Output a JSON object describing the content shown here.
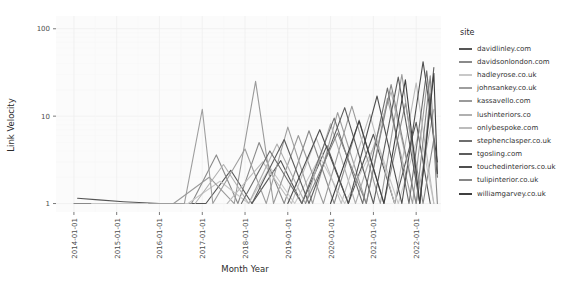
{
  "chart_data": {
    "type": "line",
    "title": "",
    "xlabel": "Month Year",
    "ylabel": "Link Velocity",
    "yscale": "log",
    "ylim": [
      0.8,
      140
    ],
    "ytick_labels": [
      "1",
      "10",
      "100"
    ],
    "ytick_values": [
      1,
      10,
      100
    ],
    "xtick_labels": [
      "2014-01-01",
      "2015-01-01",
      "2016-01-01",
      "2017-01-01",
      "2018-01-01",
      "2019-01-01",
      "2020-01-01",
      "2021-01-01",
      "2022-01-01"
    ],
    "xlim": [
      "2013-08-01",
      "2022-08-01"
    ],
    "grid": true,
    "legend_position": "right",
    "legend_title": "site",
    "series": [
      {
        "name": "davidlinley.com",
        "color": "#555555",
        "points": [
          [
            "2014-02-01",
            1.15
          ],
          [
            "2014-08-01",
            1.1
          ],
          [
            "2015-03-01",
            1.05
          ],
          [
            "2016-01-01",
            1.0
          ],
          [
            "2016-06-01",
            1.0
          ],
          [
            "2017-02-01",
            1.0
          ],
          [
            "2017-09-01",
            2.4
          ],
          [
            "2018-03-01",
            1.0
          ],
          [
            "2018-11-01",
            3.1
          ],
          [
            "2019-05-01",
            1.0
          ],
          [
            "2019-12-01",
            4.6
          ],
          [
            "2020-06-01",
            1.0
          ],
          [
            "2021-01-01",
            6.2
          ],
          [
            "2021-07-01",
            1.0
          ],
          [
            "2022-01-01",
            8.5
          ],
          [
            "2022-05-01",
            1.0
          ]
        ]
      },
      {
        "name": "davidsonlondon.com",
        "color": "#8a8a8a",
        "points": [
          [
            "2014-01-01",
            1.0
          ],
          [
            "2015-01-01",
            1.0
          ],
          [
            "2016-02-01",
            1.0
          ],
          [
            "2016-10-01",
            1.0
          ],
          [
            "2017-05-01",
            3.6
          ],
          [
            "2017-11-01",
            1.0
          ],
          [
            "2018-05-01",
            5.0
          ],
          [
            "2018-12-01",
            1.0
          ],
          [
            "2019-07-01",
            6.8
          ],
          [
            "2020-02-01",
            1.0
          ],
          [
            "2020-09-01",
            9.0
          ],
          [
            "2021-04-01",
            1.0
          ],
          [
            "2021-10-01",
            14.0
          ],
          [
            "2022-03-01",
            1.0
          ],
          [
            "2022-06-01",
            5.5
          ]
        ]
      },
      {
        "name": "hadleyrose.co.uk",
        "color": "#c8c8c8",
        "points": [
          [
            "2014-06-01",
            1.0
          ],
          [
            "2015-06-01",
            1.0
          ],
          [
            "2016-09-01",
            1.0
          ],
          [
            "2017-06-01",
            1.8
          ],
          [
            "2018-02-01",
            1.0
          ],
          [
            "2018-08-01",
            2.6
          ],
          [
            "2019-03-01",
            1.0
          ],
          [
            "2019-10-01",
            3.4
          ],
          [
            "2020-05-01",
            1.0
          ],
          [
            "2021-02-01",
            5.2
          ],
          [
            "2021-08-01",
            1.0
          ],
          [
            "2022-02-01",
            7.0
          ],
          [
            "2022-06-01",
            1.0
          ]
        ]
      },
      {
        "name": "johnsankey.co.uk",
        "color": "#9e9e9e",
        "points": [
          [
            "2015-10-01",
            1.0
          ],
          [
            "2016-08-01",
            1.0
          ],
          [
            "2017-01-01",
            12.0
          ],
          [
            "2017-04-01",
            1.0
          ],
          [
            "2018-01-01",
            4.2
          ],
          [
            "2018-07-01",
            1.0
          ],
          [
            "2019-01-01",
            7.5
          ],
          [
            "2019-08-01",
            1.0
          ],
          [
            "2020-03-01",
            11.0
          ],
          [
            "2020-11-01",
            1.0
          ],
          [
            "2021-05-01",
            16.0
          ],
          [
            "2021-12-01",
            1.0
          ],
          [
            "2022-04-01",
            22.0
          ]
        ]
      },
      {
        "name": "kassavello.com",
        "color": "#9a9a9a",
        "points": [
          [
            "2016-05-01",
            1.0
          ],
          [
            "2017-03-01",
            2.0
          ],
          [
            "2017-10-01",
            1.0
          ],
          [
            "2018-04-01",
            25.0
          ],
          [
            "2018-09-01",
            1.0
          ],
          [
            "2019-04-01",
            6.0
          ],
          [
            "2019-11-01",
            1.0
          ],
          [
            "2020-07-01",
            13.0
          ],
          [
            "2021-03-01",
            1.0
          ],
          [
            "2021-09-01",
            30.0
          ],
          [
            "2022-02-01",
            1.0
          ],
          [
            "2022-05-01",
            18.0
          ]
        ]
      },
      {
        "name": "lushinteriors.co",
        "color": "#b0b0b0",
        "points": [
          [
            "2016-11-01",
            1.0
          ],
          [
            "2017-07-01",
            2.8
          ],
          [
            "2018-02-01",
            1.0
          ],
          [
            "2018-10-01",
            4.8
          ],
          [
            "2019-06-01",
            1.0
          ],
          [
            "2020-01-01",
            8.2
          ],
          [
            "2020-08-01",
            1.0
          ],
          [
            "2021-06-01",
            19.0
          ],
          [
            "2022-01-01",
            1.0
          ],
          [
            "2022-06-01",
            12.0
          ]
        ]
      },
      {
        "name": "onlybespoke.com",
        "color": "#bcbcbc",
        "points": [
          [
            "2017-08-01",
            1.0
          ],
          [
            "2018-06-01",
            3.0
          ],
          [
            "2019-02-01",
            1.0
          ],
          [
            "2019-09-01",
            5.6
          ],
          [
            "2020-04-01",
            1.0
          ],
          [
            "2020-12-01",
            10.5
          ],
          [
            "2021-07-01",
            1.0
          ],
          [
            "2022-01-01",
            24.0
          ],
          [
            "2022-06-01",
            1.0
          ]
        ]
      },
      {
        "name": "stephenclasper.co.uk",
        "color": "#6e6e6e",
        "points": [
          [
            "2017-12-01",
            1.0
          ],
          [
            "2018-08-01",
            4.0
          ],
          [
            "2019-05-01",
            1.0
          ],
          [
            "2020-02-01",
            9.5
          ],
          [
            "2020-10-01",
            1.0
          ],
          [
            "2021-05-01",
            21.0
          ],
          [
            "2021-11-01",
            1.0
          ],
          [
            "2022-04-01",
            33.0
          ],
          [
            "2022-07-01",
            2.0
          ]
        ]
      },
      {
        "name": "tgosling.com",
        "color": "#5c5c5c",
        "points": [
          [
            "2018-03-01",
            1.0
          ],
          [
            "2018-12-01",
            5.4
          ],
          [
            "2019-07-01",
            1.0
          ],
          [
            "2020-05-01",
            12.5
          ],
          [
            "2021-01-01",
            1.0
          ],
          [
            "2021-08-01",
            28.0
          ],
          [
            "2022-02-01",
            1.0
          ],
          [
            "2022-06-01",
            36.0
          ]
        ]
      },
      {
        "name": "touchedinteriors.co.uk",
        "color": "#4f4f4f",
        "points": [
          [
            "2019-01-01",
            1.0
          ],
          [
            "2019-10-01",
            7.0
          ],
          [
            "2020-06-01",
            1.0
          ],
          [
            "2021-02-01",
            17.0
          ],
          [
            "2021-09-01",
            1.0
          ],
          [
            "2022-03-01",
            42.0
          ],
          [
            "2022-07-01",
            3.0
          ]
        ]
      },
      {
        "name": "tulipinterior.co.uk",
        "color": "#868686",
        "points": [
          [
            "2019-06-01",
            1.0
          ],
          [
            "2020-03-01",
            6.4
          ],
          [
            "2020-11-01",
            1.0
          ],
          [
            "2021-06-01",
            23.0
          ],
          [
            "2022-01-01",
            1.0
          ],
          [
            "2022-05-01",
            29.0
          ],
          [
            "2022-07-01",
            1.0
          ]
        ]
      },
      {
        "name": "williamgarvey.co.uk",
        "color": "#3f3f3f",
        "points": [
          [
            "2020-01-01",
            1.0
          ],
          [
            "2020-09-01",
            8.8
          ],
          [
            "2021-04-01",
            1.0
          ],
          [
            "2021-10-01",
            26.0
          ],
          [
            "2022-02-01",
            1.0
          ],
          [
            "2022-06-01",
            31.0
          ],
          [
            "2022-07-01",
            2.2
          ]
        ]
      }
    ]
  },
  "legend": {
    "title": "site",
    "items": [
      {
        "label": "davidlinley.com",
        "color": "#555555"
      },
      {
        "label": "davidsonlondon.com",
        "color": "#8a8a8a"
      },
      {
        "label": "hadleyrose.co.uk",
        "color": "#c8c8c8"
      },
      {
        "label": "johnsankey.co.uk",
        "color": "#9e9e9e"
      },
      {
        "label": "kassavello.com",
        "color": "#9a9a9a"
      },
      {
        "label": "lushinteriors.co",
        "color": "#b0b0b0"
      },
      {
        "label": "onlybespoke.com",
        "color": "#bcbcbc"
      },
      {
        "label": "stephenclasper.co.uk",
        "color": "#6e6e6e"
      },
      {
        "label": "tgosling.com",
        "color": "#5c5c5c"
      },
      {
        "label": "touchedinteriors.co.uk",
        "color": "#4f4f4f"
      },
      {
        "label": "tulipinterior.co.uk",
        "color": "#868686"
      },
      {
        "label": "williamgarvey.co.uk",
        "color": "#3f3f3f"
      }
    ]
  },
  "axes": {
    "y_title": "Link Velocity",
    "x_title": "Month Year"
  },
  "colors": {
    "panel_background": "#fbfbfb",
    "grid_major": "#efefef",
    "grid_minor": "#f6f6f6",
    "axis_text": "#4d4d4d",
    "axis_title": "#2b2b2b"
  }
}
